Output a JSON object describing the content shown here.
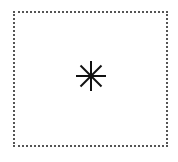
{
  "figure": {
    "frame": {
      "border_color": "#555555",
      "background": "#ffffff"
    },
    "symbol": {
      "icon": "asterisk-icon",
      "color": "#111111",
      "arms": 8
    }
  }
}
